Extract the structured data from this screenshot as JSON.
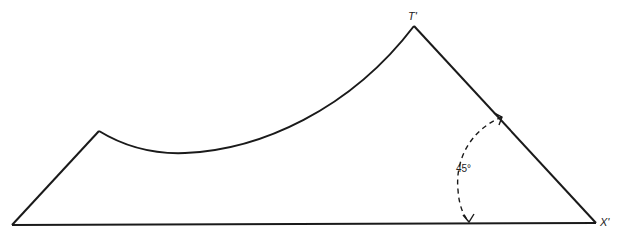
{
  "diagram": {
    "labels": {
      "top_vertex": "T'",
      "right_vertex": "X'",
      "angle": "45°"
    },
    "colors": {
      "stroke": "#1a1a1a",
      "background": "#ffffff"
    },
    "angle_degrees": 45
  }
}
